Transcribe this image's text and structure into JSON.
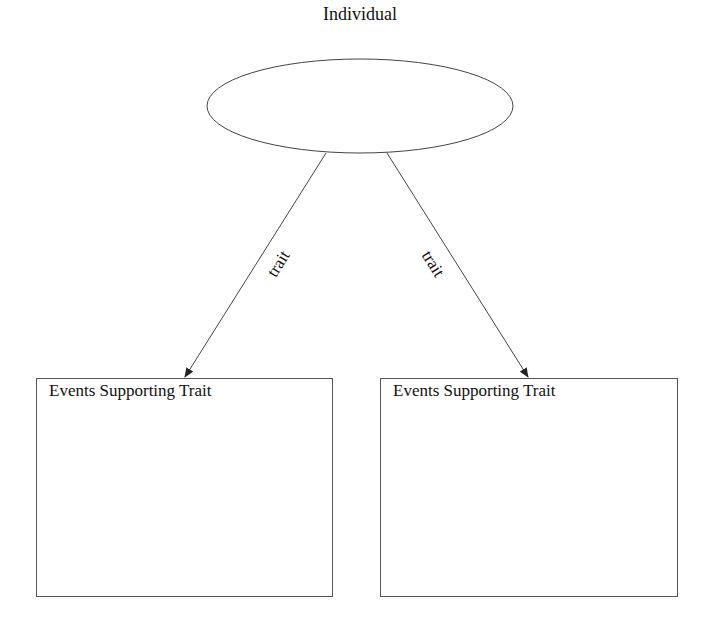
{
  "diagram": {
    "root": {
      "label": "Individual"
    },
    "edges": [
      {
        "label": "trait",
        "from": "Individual",
        "to": "left-box"
      },
      {
        "label": "trait",
        "from": "Individual",
        "to": "right-box"
      }
    ],
    "boxes": [
      {
        "id": "left-box",
        "title": "Events Supporting Trait"
      },
      {
        "id": "right-box",
        "title": "Events Supporting Trait"
      }
    ]
  }
}
